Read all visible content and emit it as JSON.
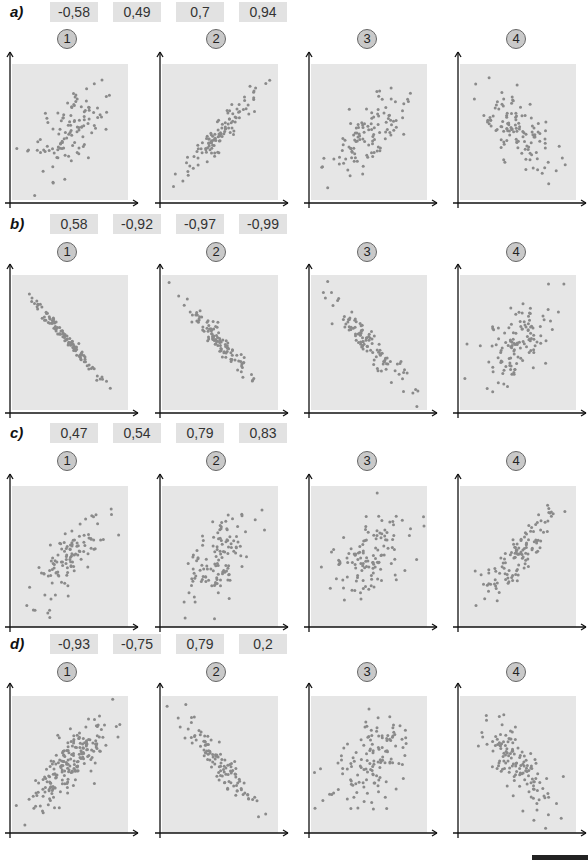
{
  "exercise": {
    "rows": [
      {
        "label": "a)",
        "coefficients": [
          "-0,58",
          "0,49",
          "0,7",
          "0,94"
        ],
        "panels": [
          {
            "number": "1",
            "n": 110,
            "r": 0.49,
            "seed": 11
          },
          {
            "number": "2",
            "n": 110,
            "r": 0.94,
            "seed": 12
          },
          {
            "number": "3",
            "n": 110,
            "r": 0.7,
            "seed": 13
          },
          {
            "number": "4",
            "n": 120,
            "r": -0.58,
            "seed": 14
          }
        ]
      },
      {
        "label": "b)",
        "coefficients": [
          "0,58",
          "-0,92",
          "-0,97",
          "-0,99"
        ],
        "panels": [
          {
            "number": "1",
            "n": 110,
            "r": -0.99,
            "seed": 21
          },
          {
            "number": "2",
            "n": 110,
            "r": -0.97,
            "seed": 22
          },
          {
            "number": "3",
            "n": 110,
            "r": -0.92,
            "seed": 23
          },
          {
            "number": "4",
            "n": 120,
            "r": 0.58,
            "seed": 24
          }
        ]
      },
      {
        "label": "c)",
        "coefficients": [
          "0,47",
          "0,54",
          "0,79",
          "0,83"
        ],
        "panels": [
          {
            "number": "1",
            "n": 110,
            "r": 0.79,
            "seed": 31
          },
          {
            "number": "2",
            "n": 120,
            "r": 0.54,
            "seed": 32
          },
          {
            "number": "3",
            "n": 120,
            "r": 0.47,
            "seed": 33
          },
          {
            "number": "4",
            "n": 120,
            "r": 0.83,
            "seed": 34
          }
        ]
      },
      {
        "label": "d)",
        "coefficients": [
          "-0,93",
          "-0,75",
          "0,79",
          "0,2"
        ],
        "panels": [
          {
            "number": "1",
            "n": 200,
            "r": 0.79,
            "seed": 41
          },
          {
            "number": "2",
            "n": 110,
            "r": -0.93,
            "seed": 42
          },
          {
            "number": "3",
            "n": 130,
            "r": 0.2,
            "seed": 43
          },
          {
            "number": "4",
            "n": 130,
            "r": -0.75,
            "seed": 44
          }
        ]
      }
    ]
  },
  "colors": {
    "plot_background": "#e6e6e6",
    "point": "#8a8a8a",
    "axis": "#111111",
    "coef_box": "#e2e2e2",
    "badge": "#c9c9c9"
  },
  "chart_data": [
    {
      "type": "scatter",
      "group": "a",
      "title": "Panel 1",
      "answer_r": 0.49,
      "xlabel": "",
      "ylabel": "",
      "grid": false
    },
    {
      "type": "scatter",
      "group": "a",
      "title": "Panel 2",
      "answer_r": 0.94,
      "xlabel": "",
      "ylabel": "",
      "grid": false
    },
    {
      "type": "scatter",
      "group": "a",
      "title": "Panel 3",
      "answer_r": 0.7,
      "xlabel": "",
      "ylabel": "",
      "grid": false
    },
    {
      "type": "scatter",
      "group": "a",
      "title": "Panel 4",
      "answer_r": -0.58,
      "xlabel": "",
      "ylabel": "",
      "grid": false
    },
    {
      "type": "scatter",
      "group": "b",
      "title": "Panel 1",
      "answer_r": -0.99
    },
    {
      "type": "scatter",
      "group": "b",
      "title": "Panel 2",
      "answer_r": -0.97
    },
    {
      "type": "scatter",
      "group": "b",
      "title": "Panel 3",
      "answer_r": -0.92
    },
    {
      "type": "scatter",
      "group": "b",
      "title": "Panel 4",
      "answer_r": 0.58
    },
    {
      "type": "scatter",
      "group": "c",
      "title": "Panel 1",
      "answer_r": 0.79
    },
    {
      "type": "scatter",
      "group": "c",
      "title": "Panel 2",
      "answer_r": 0.54
    },
    {
      "type": "scatter",
      "group": "c",
      "title": "Panel 3",
      "answer_r": 0.47
    },
    {
      "type": "scatter",
      "group": "c",
      "title": "Panel 4",
      "answer_r": 0.83
    },
    {
      "type": "scatter",
      "group": "d",
      "title": "Panel 1",
      "answer_r": 0.79
    },
    {
      "type": "scatter",
      "group": "d",
      "title": "Panel 2",
      "answer_r": -0.93
    },
    {
      "type": "scatter",
      "group": "d",
      "title": "Panel 3",
      "answer_r": 0.2
    },
    {
      "type": "scatter",
      "group": "d",
      "title": "Panel 4",
      "answer_r": -0.75
    }
  ]
}
